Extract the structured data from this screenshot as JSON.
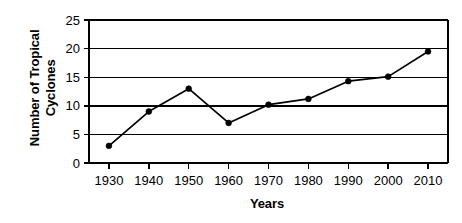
{
  "chart_data": {
    "type": "line",
    "title": "",
    "xlabel": "Years",
    "ylabel": "Number of Tropical Cyclones",
    "ylabel_lines": [
      "Number of Tropical",
      "Cyclones"
    ],
    "x": [
      1930,
      1940,
      1950,
      1960,
      1970,
      1980,
      1990,
      2000,
      2010
    ],
    "values": [
      3,
      9,
      13,
      7,
      10.2,
      11.2,
      14.3,
      15.1,
      19.5
    ],
    "categories": [
      "1930",
      "1940",
      "1950",
      "1960",
      "1970",
      "1980",
      "1990",
      "2000",
      "2010"
    ],
    "xtick_labels": [
      "1930",
      "1940",
      "1950",
      "1960",
      "1970",
      "1980",
      "1990",
      "2000",
      "2010"
    ],
    "ytick_labels": [
      "0",
      "5",
      "10",
      "15",
      "20",
      "25"
    ],
    "yticks": [
      0,
      5,
      10,
      15,
      20,
      25
    ],
    "ylim": [
      0,
      25
    ],
    "xlim": [
      1925,
      2015
    ],
    "grid": "horizontal",
    "legend": "none",
    "marker": "filled-circle",
    "line_color": "#000000",
    "marker_color": "#000000",
    "background_color": "#ffffff"
  }
}
